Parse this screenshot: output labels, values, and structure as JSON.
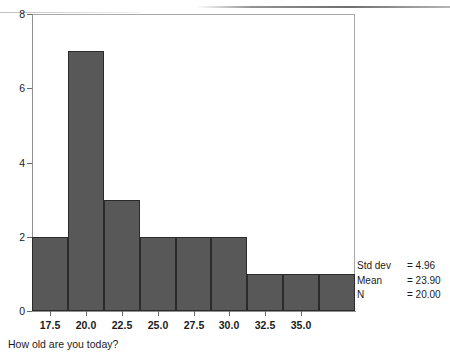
{
  "chart_data": {
    "type": "bar",
    "subtype": "histogram",
    "title": "",
    "xlabel": "How old are you today?",
    "ylabel": "",
    "xlim": [
      16.25,
      38.75
    ],
    "ylim": [
      0,
      8
    ],
    "grid": false,
    "legend": "none",
    "bin_width": 2.5,
    "bar_color": "#585858",
    "bar_edge_color": "#2b2b2b",
    "frame_color": "#a8a8a8",
    "x_tick_labels": [
      "17.5",
      "20.0",
      "22.5",
      "25.0",
      "27.5",
      "30.0",
      "32.5",
      "35.0"
    ],
    "y_tick_labels": [
      "0",
      "2",
      "4",
      "6",
      "8"
    ],
    "y_tick_values": [
      0,
      2,
      4,
      6,
      8
    ],
    "bin_centers": [
      17.5,
      20.0,
      22.5,
      25.0,
      27.5,
      30.0,
      32.5,
      35.0,
      37.5
    ],
    "values": [
      2,
      7,
      3,
      2,
      2,
      2,
      1,
      1,
      1
    ],
    "bars": [
      {
        "center": "17.5",
        "count": 2
      },
      {
        "center": "20.0",
        "count": 7
      },
      {
        "center": "22.5",
        "count": 3
      },
      {
        "center": "25.0",
        "count": 2
      },
      {
        "center": "27.5",
        "count": 2
      },
      {
        "center": "30.0",
        "count": 2
      },
      {
        "center": "32.5",
        "count": 1
      },
      {
        "center": "35.0",
        "count": 1
      },
      {
        "center": "37.5",
        "count": 1
      }
    ]
  },
  "statistics": {
    "rows": [
      {
        "label": "Std dev",
        "value": "= 4.96"
      },
      {
        "label": "Mean",
        "value": "= 23.90"
      },
      {
        "label": "N",
        "value": "= 20.00"
      }
    ]
  }
}
